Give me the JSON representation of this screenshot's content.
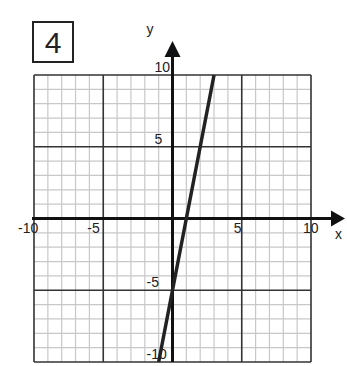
{
  "problem_number": "4",
  "chart_data": {
    "type": "line",
    "title": "",
    "xlabel": "x",
    "ylabel": "y",
    "xlim": [
      -10,
      10
    ],
    "ylim": [
      -10,
      10
    ],
    "grid": true,
    "minor_grid_step": 1,
    "major_grid_step": 5,
    "x_tick_labels": [
      "-10",
      "-5",
      "5",
      "10"
    ],
    "y_tick_labels": [
      "10",
      "5",
      "-5",
      "-10"
    ],
    "series": [
      {
        "name": "line",
        "equation": "y = 5x - 5",
        "x": [
          -1,
          0,
          1,
          2,
          3
        ],
        "y": [
          -10,
          -5,
          0,
          5,
          10
        ]
      }
    ]
  }
}
